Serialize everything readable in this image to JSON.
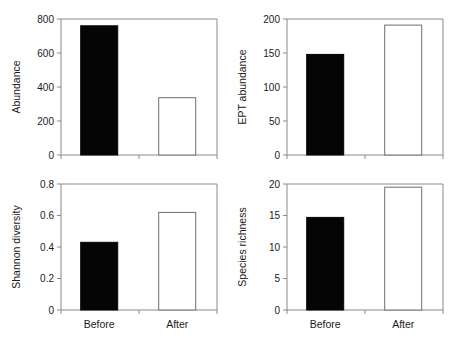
{
  "figure": {
    "title": "",
    "categories": [
      "Before",
      "After"
    ],
    "series_styles": [
      "filled",
      "open"
    ]
  },
  "chart_data": [
    {
      "type": "bar",
      "panel": "top-left",
      "title": "",
      "xlabel": "",
      "ylabel": "Abundance",
      "categories": [
        "Before",
        "After"
      ],
      "values": [
        760,
        337
      ],
      "ylim": [
        0,
        800
      ],
      "yticks": [
        0,
        200,
        400,
        600,
        800
      ],
      "ytick_labels": [
        "0",
        "200",
        "400",
        "600",
        "800"
      ],
      "grid": false,
      "legend": "none",
      "bar_fills": [
        "filled",
        "open"
      ]
    },
    {
      "type": "bar",
      "panel": "top-right",
      "title": "",
      "xlabel": "",
      "ylabel": "EPT abundance",
      "categories": [
        "Before",
        "After"
      ],
      "values": [
        148,
        191
      ],
      "ylim": [
        0,
        200
      ],
      "yticks": [
        0,
        50,
        100,
        150,
        200
      ],
      "ytick_labels": [
        "0",
        "50",
        "100",
        "150",
        "200"
      ],
      "grid": false,
      "legend": "none",
      "bar_fills": [
        "filled",
        "open"
      ]
    },
    {
      "type": "bar",
      "panel": "bottom-left",
      "title": "",
      "xlabel": "",
      "ylabel": "Shannon diversity",
      "categories": [
        "Before",
        "After"
      ],
      "values": [
        0.43,
        0.62
      ],
      "ylim": [
        0,
        0.8
      ],
      "yticks": [
        0,
        0.2,
        0.4,
        0.6,
        0.8
      ],
      "ytick_labels": [
        "0",
        "0.2",
        "0.4",
        "0.6",
        "0.8"
      ],
      "grid": false,
      "legend": "none",
      "bar_fills": [
        "filled",
        "open"
      ]
    },
    {
      "type": "bar",
      "panel": "bottom-right",
      "title": "",
      "xlabel": "",
      "ylabel": "Species richness",
      "categories": [
        "Before",
        "After"
      ],
      "values": [
        14.7,
        19.5
      ],
      "ylim": [
        0,
        20
      ],
      "yticks": [
        0,
        5,
        10,
        15,
        20
      ],
      "ytick_labels": [
        "0",
        "5",
        "10",
        "15",
        "20"
      ],
      "grid": false,
      "legend": "none",
      "bar_fills": [
        "filled",
        "open"
      ]
    }
  ]
}
